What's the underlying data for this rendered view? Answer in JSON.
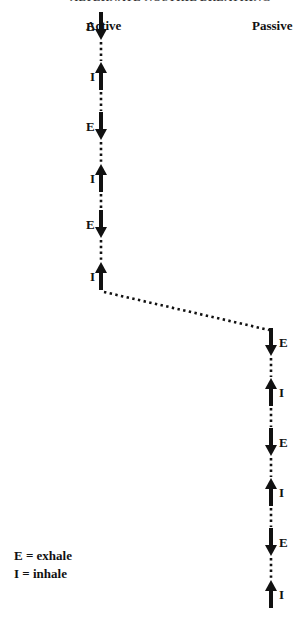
{
  "header": {
    "title": "ALTERNATE NOSTRIL BREATHING"
  },
  "columns": {
    "active": {
      "title": "Active"
    },
    "passive": {
      "title": "Passive"
    }
  },
  "active_breaths": [
    {
      "type": "E",
      "direction": "down",
      "y": 12
    },
    {
      "type": "I",
      "direction": "up",
      "y": 62
    },
    {
      "type": "E",
      "direction": "down",
      "y": 112
    },
    {
      "type": "I",
      "direction": "up",
      "y": 164
    },
    {
      "type": "E",
      "direction": "down",
      "y": 210
    },
    {
      "type": "I",
      "direction": "up",
      "y": 262
    }
  ],
  "passive_breaths": [
    {
      "type": "E",
      "direction": "down",
      "y": 328
    },
    {
      "type": "I",
      "direction": "up",
      "y": 378
    },
    {
      "type": "E",
      "direction": "down",
      "y": 428
    },
    {
      "type": "I",
      "direction": "up",
      "y": 478
    },
    {
      "type": "E",
      "direction": "down",
      "y": 528
    },
    {
      "type": "I",
      "direction": "up",
      "y": 580
    }
  ],
  "legend": {
    "exhale": "E = exhale",
    "inhale": "I = inhale"
  },
  "colors": {
    "arrow": "#111111",
    "dots": "#111111"
  }
}
